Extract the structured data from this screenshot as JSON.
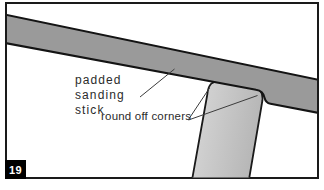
{
  "figure": {
    "number": "19",
    "labels": {
      "stick_lines": [
        "padded",
        "sanding",
        "stick"
      ],
      "corners": "round off corners"
    },
    "colors": {
      "background": "#ffffff",
      "frame_border": "#1a1a1a",
      "stick_fill": "#9a9a9a",
      "stick_outline": "#141414",
      "post_fill_light": "#d9d9d9",
      "post_fill_dark": "#b6b6b6",
      "post_outline": "#1a1a1a",
      "leader_line": "#3c3c3c",
      "label_text": "#2b2b2b",
      "badge_bg": "#000000",
      "badge_text": "#ffffff"
    }
  }
}
